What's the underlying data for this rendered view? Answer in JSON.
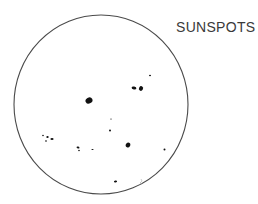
{
  "title": "SUNSPOTS",
  "sun": {
    "cx": 101,
    "cy": 104.5,
    "rx": 87,
    "ry": 89.5,
    "stroke": "#4a4a4a"
  },
  "spots": [
    {
      "cx": 89,
      "cy": 100.5,
      "rx": 3.6,
      "ry": 3.0,
      "rot": -30
    },
    {
      "cx": 134,
      "cy": 88,
      "rx": 2.4,
      "ry": 1.5,
      "rot": 10
    },
    {
      "cx": 141,
      "cy": 88.5,
      "rx": 2.0,
      "ry": 2.4,
      "rot": 30
    },
    {
      "cx": 150,
      "cy": 75.5,
      "rx": 1.0,
      "ry": 0.8,
      "rot": 0
    },
    {
      "cx": 111,
      "cy": 119,
      "rx": 0.7,
      "ry": 0.6,
      "rot": 0
    },
    {
      "cx": 110,
      "cy": 130.5,
      "rx": 1.0,
      "ry": 0.9,
      "rot": 0
    },
    {
      "cx": 128,
      "cy": 145,
      "rx": 2.2,
      "ry": 2.6,
      "rot": 25
    },
    {
      "cx": 43,
      "cy": 135.5,
      "rx": 0.8,
      "ry": 0.7,
      "rot": 0
    },
    {
      "cx": 47.5,
      "cy": 137,
      "rx": 1.2,
      "ry": 1.0,
      "rot": 0
    },
    {
      "cx": 52,
      "cy": 139,
      "rx": 1.6,
      "ry": 1.1,
      "rot": 0
    },
    {
      "cx": 46,
      "cy": 141,
      "rx": 0.9,
      "ry": 0.8,
      "rot": 0
    },
    {
      "cx": 78,
      "cy": 147.5,
      "rx": 1.5,
      "ry": 1.0,
      "rot": 15
    },
    {
      "cx": 79,
      "cy": 150.5,
      "rx": 0.8,
      "ry": 0.7,
      "rot": 0
    },
    {
      "cx": 92.5,
      "cy": 149.5,
      "rx": 1.1,
      "ry": 0.6,
      "rot": 0
    },
    {
      "cx": 164.5,
      "cy": 149.5,
      "rx": 1.0,
      "ry": 0.9,
      "rot": 0
    },
    {
      "cx": 115.5,
      "cy": 181.5,
      "rx": 1.6,
      "ry": 1.0,
      "rot": -10
    }
  ]
}
